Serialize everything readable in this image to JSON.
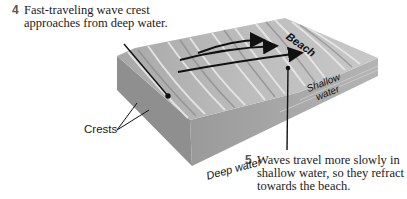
{
  "captions": {
    "step4": {
      "number": "4",
      "text": "Fast-traveling wave crest approaches from deep water."
    },
    "step5": {
      "number": "5",
      "text": "Waves travel more slowly in shallow water, so they refract towards the beach."
    }
  },
  "labels": {
    "crests": "Crests",
    "deep_water": "Deep water",
    "beach": "Beach",
    "shallow_line1": "Shallow",
    "shallow_line2": "water"
  },
  "colors": {
    "block_side": "#8e8e8e",
    "block_front": "#a6a6a6",
    "surface": "#b9b9b9",
    "arrow": "#111111"
  }
}
